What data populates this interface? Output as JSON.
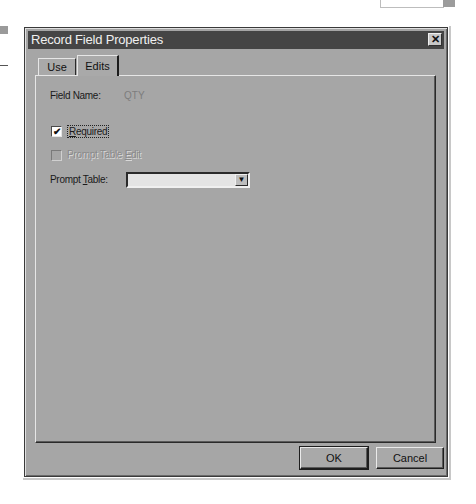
{
  "window": {
    "title": "Record Field Properties",
    "close_icon": "close-icon"
  },
  "tabs": [
    {
      "label": "Use",
      "active": false
    },
    {
      "label": "Edits",
      "active": true
    }
  ],
  "edits_panel": {
    "field_name_label": "Field Name:",
    "field_name_value": "QTY",
    "required": {
      "label_prefix": "",
      "mnemonic": "R",
      "label_rest": "equired",
      "checked": true,
      "check_glyph": "✔"
    },
    "prompt_table_edit": {
      "label_prefix": "Prompt Table ",
      "mnemonic": "E",
      "label_rest": "dit",
      "checked": false,
      "enabled": false
    },
    "prompt_table": {
      "label_prefix": "Prompt ",
      "mnemonic": "T",
      "label_rest": "able:",
      "value": "",
      "dropdown_glyph": "▼"
    }
  },
  "buttons": {
    "ok": "OK",
    "cancel": "Cancel"
  },
  "colors": {
    "dialog_face": "#a6a6a6",
    "title_bar": "#454545",
    "title_text": "#f0f0f0"
  }
}
